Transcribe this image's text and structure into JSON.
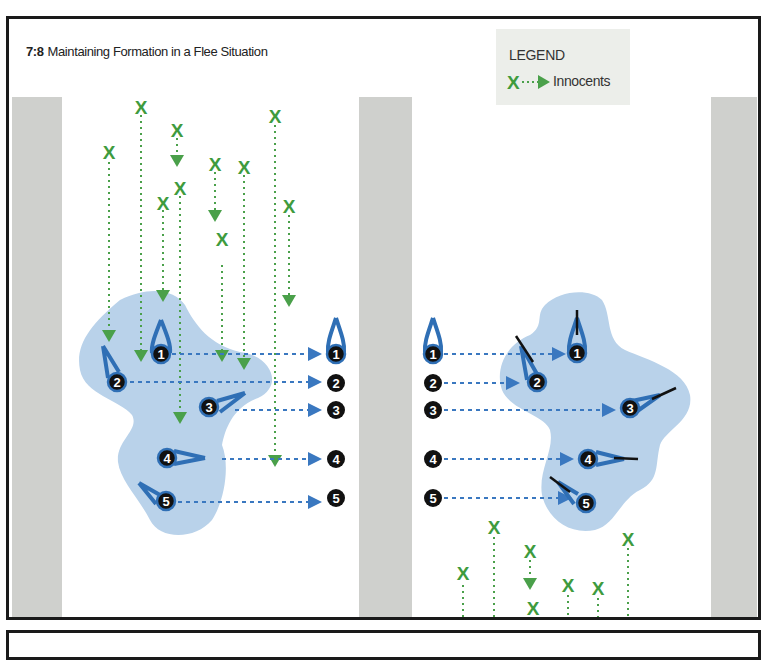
{
  "figure": {
    "number": "7:8",
    "title": "Maintaining Formation in a Flee Situation"
  },
  "legend": {
    "heading": "LEGEND",
    "items": [
      {
        "symbol": "x-dashed-arrow-icon",
        "label": "Innocents",
        "color": "#3a9a3a"
      }
    ]
  },
  "colors": {
    "innocent_green": "#3e9b3e",
    "formation_blue": "#2f6fb5",
    "cluster_fill": "#b9d2ea",
    "column_gray": "#cfd0cd",
    "marker_black": "#111111"
  },
  "panels": [
    {
      "name": "before",
      "operators": [
        {
          "id": "1",
          "label": "1",
          "target_label": "1"
        },
        {
          "id": "2",
          "label": "2",
          "target_label": "2"
        },
        {
          "id": "3",
          "label": "3",
          "target_label": "3"
        },
        {
          "id": "4",
          "label": "4",
          "target_label": "4"
        },
        {
          "id": "5",
          "label": "5",
          "target_label": "5"
        }
      ]
    },
    {
      "name": "after",
      "operators": [
        {
          "id": "1",
          "label": "1",
          "target_label": "1"
        },
        {
          "id": "2",
          "label": "2",
          "target_label": "2"
        },
        {
          "id": "3",
          "label": "3",
          "target_label": "3"
        },
        {
          "id": "4",
          "label": "4",
          "target_label": "4"
        },
        {
          "id": "5",
          "label": "5",
          "target_label": "5"
        }
      ]
    }
  ],
  "labels": {
    "m1": "1",
    "m2": "2",
    "m3": "3",
    "m4": "4",
    "m5": "5",
    "x": "X"
  }
}
